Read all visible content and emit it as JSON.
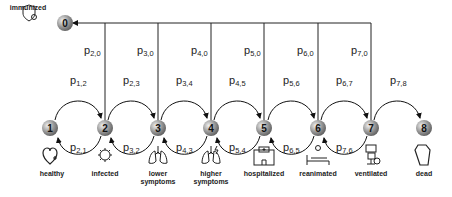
{
  "colors": {
    "node_fill_light": "#e8e8e8",
    "node_fill_dark": "#7a7a7a",
    "line": "#222222",
    "text": "#222222"
  },
  "nodes": [
    {
      "id": "0",
      "label": "0"
    },
    {
      "id": "1",
      "label": "1"
    },
    {
      "id": "2",
      "label": "2"
    },
    {
      "id": "3",
      "label": "3"
    },
    {
      "id": "4",
      "label": "4"
    },
    {
      "id": "5",
      "label": "5"
    },
    {
      "id": "6",
      "label": "6"
    },
    {
      "id": "7",
      "label": "7"
    },
    {
      "id": "8",
      "label": "8"
    }
  ],
  "forward_transitions": [
    {
      "p": "p",
      "sub": "1,2"
    },
    {
      "p": "p",
      "sub": "2,3"
    },
    {
      "p": "p",
      "sub": "3,4"
    },
    {
      "p": "p",
      "sub": "4,5"
    },
    {
      "p": "p",
      "sub": "5,6"
    },
    {
      "p": "p",
      "sub": "6,7"
    },
    {
      "p": "p",
      "sub": "7,8"
    }
  ],
  "backward_transitions": [
    {
      "p": "p",
      "sub": "2,1"
    },
    {
      "p": "p",
      "sub": "3,2"
    },
    {
      "p": "p",
      "sub": "4,3"
    },
    {
      "p": "p",
      "sub": "5,4"
    },
    {
      "p": "p",
      "sub": "6,5"
    },
    {
      "p": "p",
      "sub": "7,6"
    }
  ],
  "immunization_transitions": [
    {
      "p": "p",
      "sub": "2,0"
    },
    {
      "p": "p",
      "sub": "3,0"
    },
    {
      "p": "p",
      "sub": "4,0"
    },
    {
      "p": "p",
      "sub": "5,0"
    },
    {
      "p": "p",
      "sub": "6,0"
    },
    {
      "p": "p",
      "sub": "7,0"
    }
  ],
  "immunized": {
    "label": "immunized",
    "icon": "shield-virus-icon"
  },
  "states": [
    {
      "label_line1": "healthy",
      "label_line2": "",
      "icon": "heart-plus-icon"
    },
    {
      "label_line1": "infected",
      "label_line2": "",
      "icon": "virus-icon"
    },
    {
      "label_line1": "lower",
      "label_line2": "symptoms",
      "icon": "lungs-icon"
    },
    {
      "label_line1": "higher",
      "label_line2": "symptoms",
      "icon": "lungs-lightning-icon"
    },
    {
      "label_line1": "hospitalized",
      "label_line2": "",
      "icon": "hospital-icon"
    },
    {
      "label_line1": "reanimated",
      "label_line2": "",
      "icon": "hospital-bed-icon"
    },
    {
      "label_line1": "ventilated",
      "label_line2": "",
      "icon": "ventilator-icon"
    },
    {
      "label_line1": "dead",
      "label_line2": "",
      "icon": "coffin-icon"
    }
  ]
}
